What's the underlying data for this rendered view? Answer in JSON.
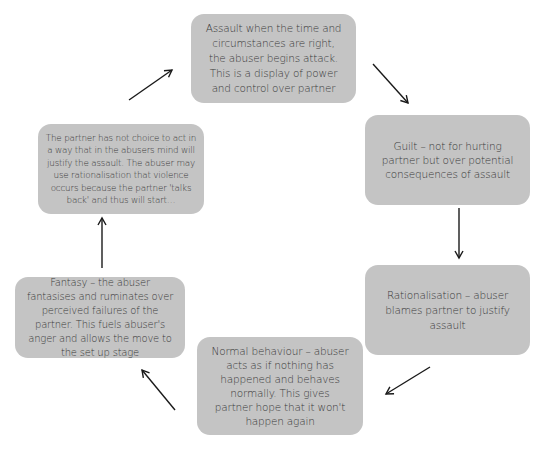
{
  "diagram": {
    "type": "cycle",
    "colors": {
      "box_fill": "#c4c4c4",
      "text": "#3a3a3a",
      "arrow": "#1a1a1a",
      "background": "#ffffff"
    },
    "stages": [
      {
        "id": "assault",
        "text": "Assault when the time and circumstances are right, the abuser begins attack. This is a display of power and control over partner"
      },
      {
        "id": "guilt",
        "text": "Guilt – not for hurting partner but over potential consequences of assault"
      },
      {
        "id": "rationalisation",
        "text": "Rationalisation – abuser blames partner to justify assault"
      },
      {
        "id": "normal-behaviour",
        "text": "Normal behaviour – abuser acts as if nothing has happened and behaves normally. This gives partner hope that it won't happen again"
      },
      {
        "id": "fantasy",
        "text": "Fantasy – the abuser fantasises and ruminates over perceived failures of the partner. This fuels abuser's anger and allows the move to the set up stage"
      },
      {
        "id": "set-up",
        "text": "The partner has not choice to act in a way that in the abusers mind will justify the assault. The abuser may use rationalisation that violence occurs because the partner 'talks back' and thus will start…"
      }
    ],
    "arrows": [
      {
        "from": "assault",
        "to": "guilt"
      },
      {
        "from": "guilt",
        "to": "rationalisation"
      },
      {
        "from": "rationalisation",
        "to": "normal-behaviour"
      },
      {
        "from": "normal-behaviour",
        "to": "fantasy"
      },
      {
        "from": "fantasy",
        "to": "set-up"
      },
      {
        "from": "set-up",
        "to": "assault"
      }
    ]
  }
}
